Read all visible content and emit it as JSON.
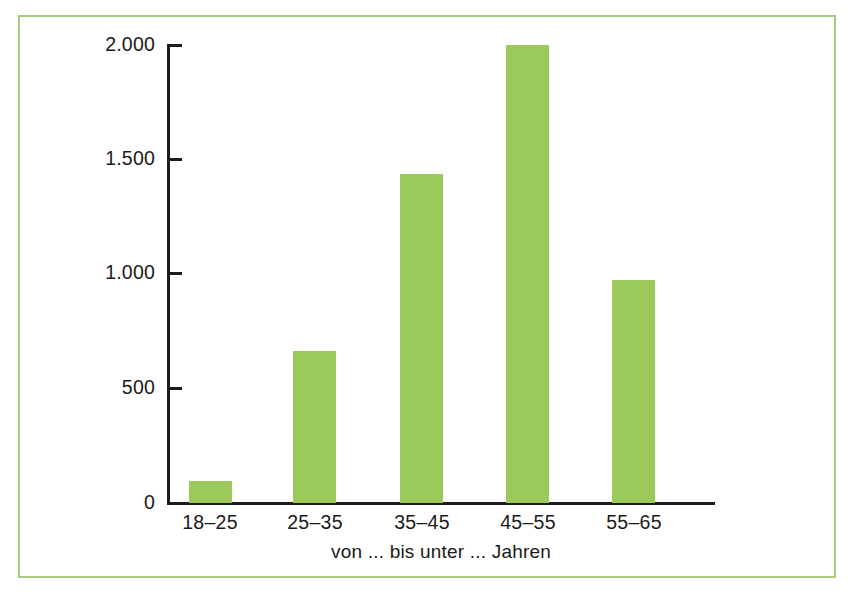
{
  "chart_data": {
    "type": "bar",
    "title": "",
    "subtitle": "",
    "categories": [
      "18–25",
      "25–35",
      "35–45",
      "45–55",
      "55–65"
    ],
    "values": [
      95,
      665,
      1435,
      2000,
      975
    ],
    "series": [
      {
        "name": "",
        "values": [
          95,
          665,
          1435,
          2000,
          975
        ]
      }
    ],
    "xlabel": "von ... bis unter ... Jahren",
    "ylabel": "",
    "ylim": [
      0,
      2000
    ],
    "yticks": [
      0,
      500,
      1000,
      1500,
      2000
    ],
    "ytick_labels": [
      "0",
      "500",
      "1.000",
      "1.500",
      "2.000"
    ],
    "grid": false,
    "legend": false,
    "legend_position": "none",
    "bar_color": "#9bc95a",
    "axis_color": "#1c1c1c",
    "frame_color": "#a6ca7d",
    "background_color": "#ffffff",
    "annotations": []
  },
  "axes": {
    "x_title": "von ... bis unter ... Jahren",
    "y_title": ""
  }
}
